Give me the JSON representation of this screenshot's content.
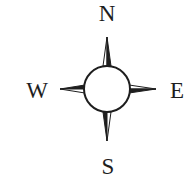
{
  "compass": {
    "labels": {
      "north": "N",
      "south": "S",
      "west": "W",
      "east": "E"
    },
    "colors": {
      "ink": "#1e1e1e",
      "background": "#ffffff"
    }
  }
}
